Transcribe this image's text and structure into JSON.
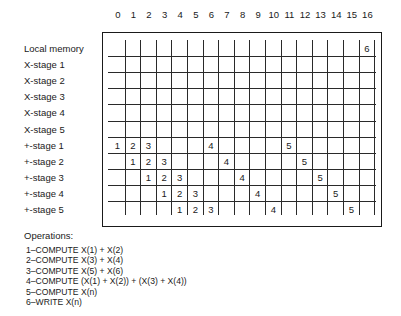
{
  "diagram": {
    "columns": [
      "0",
      "1",
      "2",
      "3",
      "4",
      "5",
      "6",
      "7",
      "8",
      "9",
      "10",
      "11",
      "12",
      "13",
      "14",
      "15",
      "16"
    ],
    "rows": [
      {
        "label": "Local memory",
        "cells": {
          "16": "6"
        }
      },
      {
        "label": "X-stage 1",
        "cells": {}
      },
      {
        "label": "X-stage 2",
        "cells": {}
      },
      {
        "label": "X-stage 3",
        "cells": {}
      },
      {
        "label": "X-stage 4",
        "cells": {}
      },
      {
        "label": "X-stage 5",
        "cells": {}
      },
      {
        "label": "+-stage 1",
        "cells": {
          "0": "1",
          "1": "2",
          "2": "3",
          "6": "4",
          "11": "5"
        }
      },
      {
        "label": "+-stage 2",
        "cells": {
          "1": "1",
          "2": "2",
          "3": "3",
          "7": "4",
          "12": "5"
        }
      },
      {
        "label": "+-stage 3",
        "cells": {
          "2": "1",
          "3": "2",
          "4": "3",
          "8": "4",
          "13": "5"
        }
      },
      {
        "label": "+-stage 4",
        "cells": {
          "3": "1",
          "4": "2",
          "5": "3",
          "9": "4",
          "14": "5"
        }
      },
      {
        "label": "+-stage 5",
        "cells": {
          "4": "1",
          "5": "2",
          "6": "3",
          "10": "4",
          "15": "5"
        }
      }
    ]
  },
  "operations": {
    "title": "Operations:",
    "items": [
      "1–COMPUTE X(1) + X(2)",
      "2–COMPUTE X(3) + X(4)",
      "3–COMPUTE X(5) + X(6)",
      "4–COMPUTE (X(1) + X(2)) + (X(3) + X(4))",
      "5–COMPUTE X(n)",
      "6–WRITE X(n)"
    ]
  }
}
